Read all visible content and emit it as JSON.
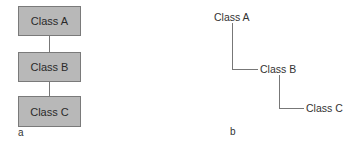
{
  "panel_a": {
    "label": "a",
    "boxes": [
      "Class A",
      "Class B",
      "Class C"
    ]
  },
  "panel_b": {
    "label": "b",
    "nodes": [
      "Class A",
      "Class B",
      "Class C"
    ]
  },
  "colors": {
    "box_fill": "#b8b8b8",
    "box_border": "#7a7a7a",
    "line": "#777777"
  }
}
